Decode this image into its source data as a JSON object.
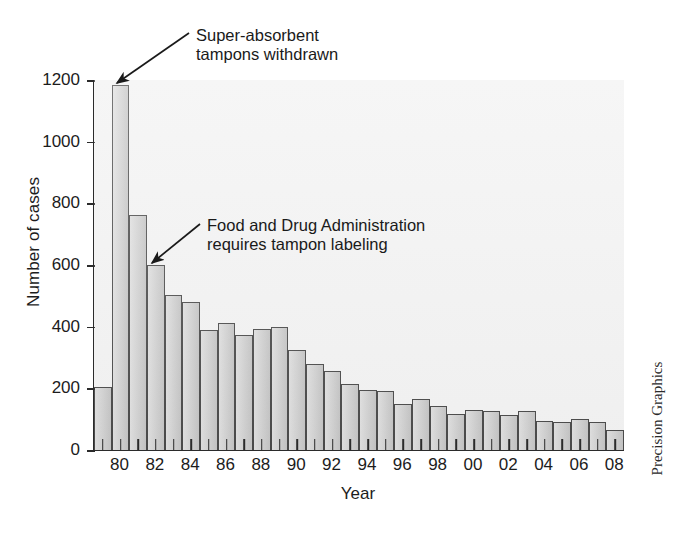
{
  "chart_data": {
    "type": "bar",
    "title": "",
    "xlabel": "Year",
    "ylabel": "Number of cases",
    "ylim": [
      0,
      1200
    ],
    "xlim_note": "1979 through 2008, one bar per year",
    "grid": false,
    "legend": "none",
    "y_ticks": [
      1200,
      1000,
      800,
      600,
      400,
      200,
      0
    ],
    "x_tick_labels": [
      "80",
      "82",
      "84",
      "86",
      "88",
      "90",
      "92",
      "94",
      "96",
      "98",
      "00",
      "02",
      "04",
      "06",
      "08"
    ],
    "categories": [
      "1979",
      "1980",
      "1981",
      "1982",
      "1983",
      "1984",
      "1985",
      "1986",
      "1987",
      "1988",
      "1989",
      "1990",
      "1991",
      "1992",
      "1993",
      "1994",
      "1995",
      "1996",
      "1997",
      "1998",
      "1999",
      "2000",
      "2001",
      "2002",
      "2003",
      "2004",
      "2005",
      "2006",
      "2007",
      "2008"
    ],
    "values": [
      205,
      1184,
      762,
      600,
      503,
      480,
      390,
      413,
      373,
      392,
      400,
      323,
      280,
      255,
      213,
      194,
      192,
      150,
      165,
      143,
      118,
      130,
      125,
      113,
      128,
      95,
      92,
      100,
      90,
      65
    ],
    "series_name": "Number of cases",
    "annotations": [
      {
        "id": "super-absorbent",
        "text": "Super-absorbent\ntampons withdrawn",
        "points_to_category": "1980",
        "points_to_value": 1184
      },
      {
        "id": "fda-labeling",
        "text": "Food and Drug Administration\nrequires tampon labeling",
        "points_to_category": "1982",
        "points_to_value": 600
      }
    ],
    "colors": {
      "bar_fill": "#cfcfcf",
      "bar_stroke": "#4a4a4a",
      "plot_background": "#f3f3f3",
      "axis": "#2b2b2b",
      "text": "#1a1a1a",
      "page_background": "#ffffff"
    }
  },
  "credit": {
    "text": "Precision Graphics"
  }
}
